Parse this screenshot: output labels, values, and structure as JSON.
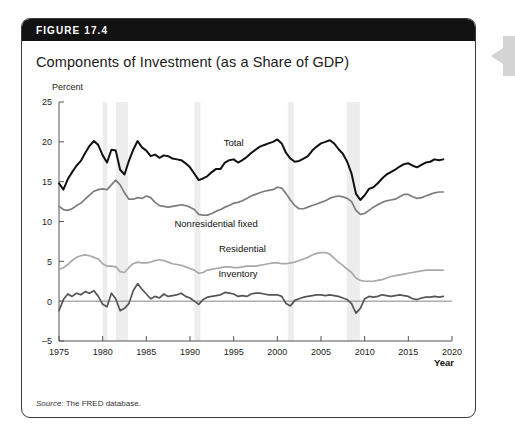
{
  "figure": {
    "number_label": "FIGURE 17.4",
    "title": "Components of Investment (as a Share of GDP)",
    "source_prefix": "Source:",
    "source_text": " The FRED database."
  },
  "axis": {
    "y_unit_label": "Percent",
    "x_axis_label": "Year",
    "y_ticks": [
      "25",
      "20",
      "15",
      "10",
      "5",
      "0",
      "-5"
    ],
    "x_ticks": [
      "1975",
      "1980",
      "1985",
      "1990",
      "1995",
      "2000",
      "2005",
      "2010",
      "2015",
      "2020"
    ]
  },
  "series_labels": {
    "total": "Total",
    "nonresidential": "Nonresidential fixed",
    "residential": "Residential",
    "inventory": "Inventory"
  },
  "colors": {
    "total": "#111111",
    "nonresidential": "#7d7d7d",
    "residential": "#a9a9a9",
    "inventory": "#555555",
    "recession_band": "#ededed",
    "header_bar": "#121212",
    "frame": "#3a3a3a",
    "side_arrow": "#d4d4d4"
  },
  "chart_data": {
    "type": "line",
    "title": "Components of Investment (as a Share of GDP)",
    "xlabel": "Year",
    "ylabel": "Percent",
    "xlim": [
      1975,
      2020
    ],
    "ylim": [
      -5,
      25
    ],
    "ytick_step": 5,
    "xtick_step": 5,
    "grid": false,
    "legend": "inline-annotations",
    "recession_bands": [
      {
        "start": 1980.0,
        "end": 1980.55
      },
      {
        "start": 1981.5,
        "end": 1982.9
      },
      {
        "start": 1990.5,
        "end": 1991.2
      },
      {
        "start": 2001.2,
        "end": 2001.9
      },
      {
        "start": 2007.95,
        "end": 2009.45
      }
    ],
    "x": [
      1975,
      1975.5,
      1976,
      1976.5,
      1977,
      1977.5,
      1978,
      1978.5,
      1979,
      1979.5,
      1980,
      1980.5,
      1981,
      1981.5,
      1982,
      1982.5,
      1983,
      1983.5,
      1984,
      1984.5,
      1985,
      1985.5,
      1986,
      1986.5,
      1987,
      1987.5,
      1988,
      1988.5,
      1989,
      1989.5,
      1990,
      1990.5,
      1991,
      1991.5,
      1992,
      1992.5,
      1993,
      1993.5,
      1994,
      1994.5,
      1995,
      1995.5,
      1996,
      1996.5,
      1997,
      1997.5,
      1998,
      1998.5,
      1999,
      1999.5,
      2000,
      2000.5,
      2001,
      2001.5,
      2002,
      2002.5,
      2003,
      2003.5,
      2004,
      2004.5,
      2005,
      2005.5,
      2006,
      2006.5,
      2007,
      2007.5,
      2008,
      2008.5,
      2009,
      2009.5,
      2010,
      2010.5,
      2011,
      2011.5,
      2012,
      2012.5,
      2013,
      2013.5,
      2014,
      2014.5,
      2015,
      2015.5,
      2016,
      2016.5,
      2017,
      2017.5,
      2018,
      2018.5,
      2019
    ],
    "series": [
      {
        "name": "Total",
        "color": "#111111",
        "values": [
          14.8,
          14.0,
          15.3,
          16.2,
          17.0,
          17.6,
          18.6,
          19.5,
          20.1,
          19.6,
          18.3,
          17.4,
          19.0,
          18.9,
          16.5,
          15.9,
          17.6,
          19.0,
          20.1,
          19.3,
          18.9,
          18.2,
          18.4,
          18.0,
          18.3,
          18.2,
          17.9,
          17.8,
          17.7,
          17.3,
          16.8,
          16.0,
          15.2,
          15.4,
          15.7,
          16.2,
          16.6,
          16.6,
          17.4,
          17.7,
          17.8,
          17.4,
          17.7,
          18.1,
          18.6,
          19.0,
          19.4,
          19.6,
          19.8,
          20.0,
          20.3,
          19.8,
          18.6,
          17.9,
          17.5,
          17.6,
          17.9,
          18.2,
          18.9,
          19.4,
          19.8,
          20.0,
          20.2,
          19.8,
          19.1,
          18.5,
          17.5,
          16.0,
          13.5,
          12.7,
          13.3,
          14.1,
          14.3,
          14.8,
          15.4,
          15.9,
          16.2,
          16.5,
          16.9,
          17.2,
          17.3,
          17.0,
          16.8,
          17.1,
          17.4,
          17.5,
          17.8,
          17.7,
          17.8
        ]
      },
      {
        "name": "Nonresidential fixed",
        "color": "#7d7d7d",
        "values": [
          11.9,
          11.5,
          11.4,
          11.6,
          12.0,
          12.3,
          12.8,
          13.3,
          13.8,
          14.0,
          14.1,
          14.0,
          14.6,
          15.2,
          14.6,
          13.6,
          12.8,
          12.8,
          13.0,
          12.9,
          13.2,
          13.0,
          12.4,
          12.0,
          11.9,
          11.8,
          11.9,
          12.0,
          12.1,
          12.0,
          11.8,
          11.5,
          10.9,
          10.8,
          10.8,
          11.0,
          11.3,
          11.5,
          11.8,
          12.0,
          12.3,
          12.4,
          12.6,
          12.9,
          13.2,
          13.4,
          13.6,
          13.8,
          13.9,
          14.0,
          14.3,
          14.2,
          13.5,
          12.7,
          12.0,
          11.6,
          11.6,
          11.8,
          12.0,
          12.2,
          12.4,
          12.6,
          12.9,
          13.1,
          13.2,
          13.1,
          12.9,
          12.5,
          11.4,
          10.9,
          11.0,
          11.4,
          11.8,
          12.1,
          12.4,
          12.6,
          12.7,
          12.8,
          13.1,
          13.4,
          13.4,
          13.1,
          12.9,
          13.0,
          13.2,
          13.4,
          13.6,
          13.7,
          13.7
        ]
      },
      {
        "name": "Residential",
        "color": "#a9a9a9",
        "values": [
          4.0,
          4.2,
          4.6,
          5.1,
          5.5,
          5.7,
          5.8,
          5.7,
          5.5,
          5.3,
          4.7,
          4.4,
          4.4,
          4.3,
          3.7,
          3.6,
          4.2,
          4.7,
          4.9,
          4.8,
          4.8,
          4.9,
          5.1,
          5.2,
          5.1,
          4.9,
          4.7,
          4.6,
          4.5,
          4.3,
          4.1,
          3.9,
          3.5,
          3.6,
          3.9,
          4.0,
          4.1,
          4.2,
          4.3,
          4.3,
          4.2,
          4.2,
          4.3,
          4.4,
          4.4,
          4.4,
          4.5,
          4.6,
          4.7,
          4.8,
          4.8,
          4.7,
          4.7,
          4.8,
          4.9,
          5.1,
          5.3,
          5.5,
          5.8,
          6.0,
          6.1,
          6.1,
          5.9,
          5.4,
          4.9,
          4.5,
          4.0,
          3.6,
          2.9,
          2.6,
          2.5,
          2.5,
          2.5,
          2.6,
          2.7,
          2.9,
          3.1,
          3.2,
          3.3,
          3.4,
          3.5,
          3.6,
          3.7,
          3.8,
          3.9,
          3.9,
          3.9,
          3.9,
          3.9
        ]
      },
      {
        "name": "Inventory",
        "color": "#555555",
        "values": [
          -1.2,
          0.2,
          0.9,
          0.6,
          1.0,
          0.8,
          1.2,
          1.0,
          1.3,
          0.6,
          -0.4,
          -0.7,
          1.0,
          0.3,
          -1.2,
          -0.9,
          -0.3,
          1.3,
          2.2,
          1.5,
          0.9,
          0.3,
          0.6,
          0.4,
          0.9,
          0.6,
          0.7,
          0.8,
          1.0,
          0.6,
          0.4,
          0.0,
          -0.4,
          0.2,
          0.5,
          0.6,
          0.7,
          0.8,
          1.1,
          1.0,
          0.9,
          0.6,
          0.7,
          0.6,
          0.9,
          1.0,
          1.0,
          0.9,
          0.8,
          0.8,
          0.8,
          0.6,
          -0.3,
          -0.6,
          0.1,
          0.3,
          0.5,
          0.6,
          0.7,
          0.8,
          0.8,
          0.7,
          0.8,
          0.7,
          0.6,
          0.4,
          0.2,
          -0.3,
          -1.5,
          -0.9,
          0.3,
          0.6,
          0.5,
          0.6,
          0.8,
          0.7,
          0.6,
          0.7,
          0.8,
          0.7,
          0.6,
          0.3,
          0.2,
          0.4,
          0.5,
          0.5,
          0.6,
          0.5,
          0.6
        ]
      }
    ],
    "annotations": [
      {
        "text": "Total",
        "x": 1995.0,
        "y": 19.5
      },
      {
        "text": "Nonresidential fixed",
        "x": 1993.0,
        "y": 9.3
      },
      {
        "text": "Residential",
        "x": 1996.0,
        "y": 6.2
      },
      {
        "text": "Inventory",
        "x": 1995.5,
        "y": 3.0
      }
    ]
  }
}
